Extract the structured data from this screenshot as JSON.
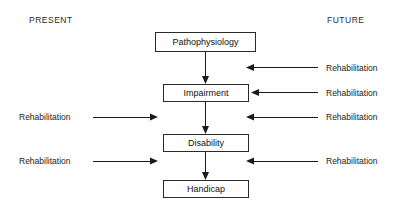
{
  "diagram": {
    "headers": {
      "left": "PRESENT",
      "right": "FUTURE"
    },
    "nodes": [
      {
        "id": "pathophysiology",
        "label": "Pathophysiology"
      },
      {
        "id": "impairment",
        "label": "Impairment"
      },
      {
        "id": "disability",
        "label": "Disability"
      },
      {
        "id": "handicap",
        "label": "Handicap"
      }
    ],
    "flow_arrows": [
      {
        "from": "pathophysiology",
        "to": "impairment",
        "direction": "down"
      },
      {
        "from": "impairment",
        "to": "disability",
        "direction": "down"
      },
      {
        "from": "disability",
        "to": "handicap",
        "direction": "down"
      }
    ],
    "right_inputs": [
      {
        "id": "right-1",
        "label": "Rehabilitation",
        "direction": "left",
        "target": "pathophysiology-to-impairment"
      },
      {
        "id": "right-2",
        "label": "Rehabilitation",
        "direction": "left",
        "target": "impairment"
      },
      {
        "id": "right-3",
        "label": "Rehabilitation",
        "direction": "left",
        "target": "impairment-to-disability"
      },
      {
        "id": "right-4",
        "label": "Rehabilitation",
        "direction": "left",
        "target": "disability-to-handicap"
      }
    ],
    "left_inputs": [
      {
        "id": "left-1",
        "label": "Rehabilitation",
        "direction": "right",
        "target": "impairment-to-disability"
      },
      {
        "id": "left-2",
        "label": "Rehabilitation",
        "direction": "right",
        "target": "disability-to-handicap"
      }
    ],
    "colors": {
      "background": "#ffffff",
      "stroke": "#1a1a1a",
      "text": "#111111",
      "box_border": "#2a2a2a"
    }
  }
}
